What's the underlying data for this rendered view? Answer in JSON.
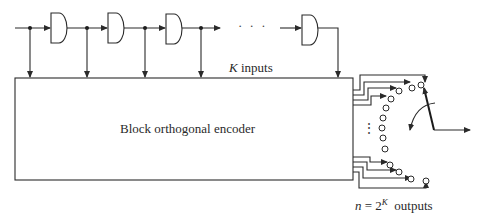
{
  "diagram": {
    "shift_register": {
      "stages_shown": 4,
      "ellipsis": "· · ·",
      "stage_x": [
        51,
        108,
        166,
        302
      ]
    },
    "inputs_label": {
      "var": "K",
      "text": " inputs"
    },
    "encoder_label": "Block orthogonal encoder",
    "outputs_label": {
      "lhs": "n",
      "eq": " = 2",
      "exp": "K",
      "text": "  outputs"
    },
    "vertical_ellipsis": "⋮",
    "colors": {
      "line": "#2a2a2a",
      "background": "#ffffff"
    }
  }
}
